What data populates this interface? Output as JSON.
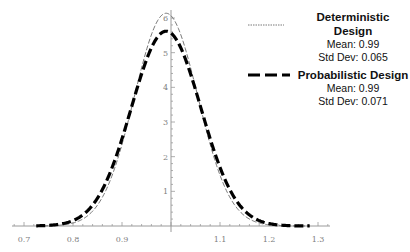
{
  "chart_data": {
    "type": "line",
    "title": "",
    "xlabel": "",
    "ylabel": "",
    "xlim": [
      0.7,
      1.3
    ],
    "ylim": [
      0,
      6
    ],
    "x_ticks": [
      0.7,
      0.8,
      0.9,
      1.1,
      1.2,
      1.3
    ],
    "x_tick_labels": [
      "0.7",
      "0.8",
      "0.9",
      "1.1",
      "1.2",
      "1.3"
    ],
    "y_ticks": [
      1,
      2,
      3,
      4,
      5,
      6
    ],
    "y_tick_labels": [
      "1",
      "2",
      "3",
      "4",
      "5",
      "6"
    ],
    "y_axis_at_x": 1.0,
    "grid": false,
    "legend_placement": "top-right",
    "series": [
      {
        "name": "Deterministic Design",
        "distribution": "normal",
        "mean": 0.99,
        "std_dev": 0.065,
        "peak_density": 6.14,
        "line_style": "thin-dotted",
        "color": "#555555",
        "legend_lines": [
          "Mean: 0.99",
          "Std Dev: 0.065"
        ]
      },
      {
        "name": "Probabilistic Design",
        "distribution": "normal",
        "mean": 0.99,
        "std_dev": 0.071,
        "peak_density": 5.62,
        "line_style": "thick-dashed",
        "color": "#000000",
        "legend_lines": [
          "Mean: 0.99",
          "Std Dev: 0.071"
        ]
      }
    ]
  }
}
